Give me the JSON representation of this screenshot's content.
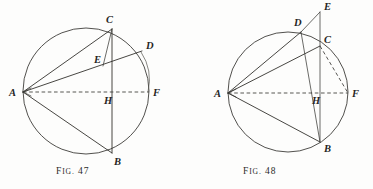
{
  "plate": {
    "background_color": "#fdfdfc",
    "ink_color": "#33322e",
    "width": 373,
    "height": 189
  },
  "figures": [
    {
      "id": "fig-47",
      "caption_prefix": "F",
      "caption_ig": "IG.",
      "caption_number": "47",
      "caption_full": "FIG. 47",
      "circle": {
        "cx": 86,
        "cy": 91,
        "r": 63
      },
      "points": [
        {
          "name": "A",
          "x": 23,
          "y": 92,
          "label_x": 9,
          "label_y": 96
        },
        {
          "name": "B",
          "x": 112,
          "y": 153,
          "label_x": 114,
          "label_y": 165
        },
        {
          "name": "C",
          "x": 112,
          "y": 29,
          "label_x": 106,
          "label_y": 23
        },
        {
          "name": "D",
          "x": 142,
          "y": 51,
          "label_x": 146,
          "label_y": 49
        },
        {
          "name": "E",
          "x": 103,
          "y": 66,
          "label_x": 94,
          "label_y": 63
        },
        {
          "name": "F",
          "x": 149,
          "y": 92,
          "label_x": 153,
          "label_y": 96
        },
        {
          "name": "H",
          "x": 112,
          "y": 92,
          "label_x": 104,
          "label_y": 104
        }
      ],
      "segments": [
        {
          "name": "A-C",
          "from": "A",
          "to": "C",
          "style": "solid"
        },
        {
          "name": "A-D",
          "from": "A",
          "to": "D",
          "style": "solid"
        },
        {
          "name": "A-B",
          "from": "A",
          "to": "B",
          "style": "solid"
        },
        {
          "name": "C-B",
          "from": "C",
          "to": "B",
          "style": "solid"
        },
        {
          "name": "C-E",
          "from": "C",
          "to": "E",
          "style": "solid"
        },
        {
          "name": "A-F",
          "from": "A",
          "to": "F",
          "style": "dashed"
        }
      ],
      "arc_mark": {
        "from": "D",
        "to": "F",
        "description": "small arc from D to F"
      }
    },
    {
      "id": "fig-48",
      "caption_prefix": "F",
      "caption_ig": "IG.",
      "caption_number": "48",
      "caption_full": "FIG. 48",
      "circle": {
        "cx": 102,
        "cy": 92,
        "r": 60
      },
      "points": [
        {
          "name": "A",
          "x": 42,
          "y": 93,
          "label_x": 28,
          "label_y": 97
        },
        {
          "name": "B",
          "x": 134,
          "y": 142,
          "label_x": 138,
          "label_y": 152
        },
        {
          "name": "C",
          "x": 134,
          "y": 46,
          "label_x": 138,
          "label_y": 43
        },
        {
          "name": "D",
          "x": 115,
          "y": 32,
          "label_x": 108,
          "label_y": 26
        },
        {
          "name": "E",
          "x": 134,
          "y": 12,
          "label_x": 138,
          "label_y": 10
        },
        {
          "name": "F",
          "x": 162,
          "y": 93,
          "label_x": 166,
          "label_y": 97
        },
        {
          "name": "H",
          "x": 134,
          "y": 93,
          "label_x": 126,
          "label_y": 104
        }
      ],
      "segments": [
        {
          "name": "A-D",
          "from": "A",
          "to": "D",
          "style": "solid"
        },
        {
          "name": "A-C",
          "from": "A",
          "to": "C",
          "style": "solid"
        },
        {
          "name": "A-B",
          "from": "A",
          "to": "B",
          "style": "solid"
        },
        {
          "name": "D-E",
          "from": "D",
          "to": "E",
          "style": "solid"
        },
        {
          "name": "D-B",
          "from": "D",
          "to": "B",
          "style": "solid"
        },
        {
          "name": "E-B",
          "from": "E",
          "to": "B",
          "style": "solid"
        },
        {
          "name": "C-B",
          "from": "C",
          "to": "B",
          "style": "solid"
        },
        {
          "name": "A-F",
          "from": "A",
          "to": "F",
          "style": "dashed"
        },
        {
          "name": "C-F",
          "from": "C",
          "to": "F",
          "style": "dashed"
        }
      ]
    }
  ]
}
